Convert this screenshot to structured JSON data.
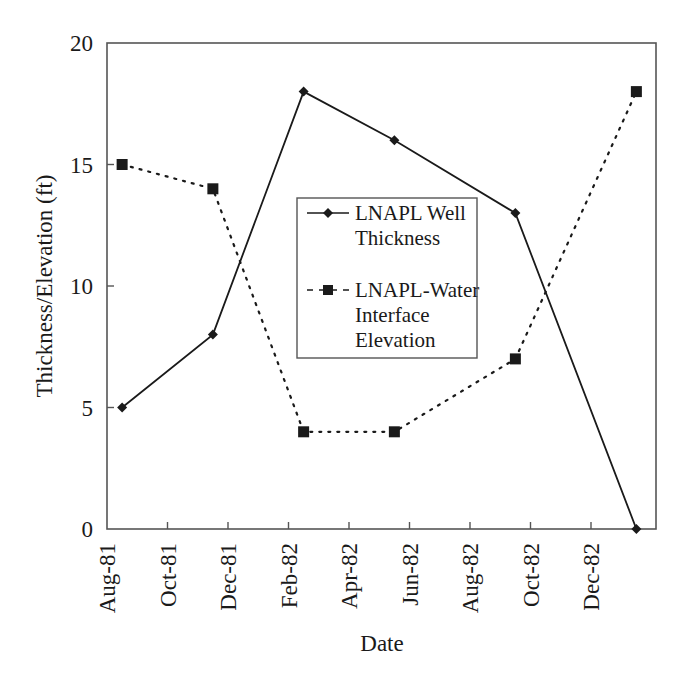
{
  "chart_data": {
    "type": "line",
    "title": "",
    "xlabel": "Date",
    "ylabel": "Thickness/Elevation (ft)",
    "ylim": [
      0,
      20
    ],
    "yticks": [
      0,
      5,
      10,
      15,
      20
    ],
    "grid": false,
    "legend_position": "center (inside plot)",
    "x_tick_labels": [
      "Aug-81",
      "Oct-81",
      "Dec-81",
      "Feb-82",
      "Apr-82",
      "Jun-82",
      "Aug-82",
      "Oct-82",
      "Dec-82"
    ],
    "x": [
      "Aug-81 (mid)",
      "Nov-81 (mid)",
      "Feb-82",
      "May-82 (mid)",
      "Sep-82",
      "Jan-83"
    ],
    "series": [
      {
        "name": "LNAPL Well Thickness",
        "marker": "diamond",
        "line_style": "solid",
        "x_month_index": [
          0.5,
          3.5,
          6.5,
          9.5,
          13.5,
          17.5
        ],
        "values": [
          5,
          8,
          18,
          16,
          13,
          0
        ]
      },
      {
        "name": "LNAPL-Water Interface Elevation",
        "marker": "square",
        "line_style": "dotted",
        "x_month_index": [
          0.5,
          3.5,
          6.5,
          9.5,
          13.5,
          17.5
        ],
        "values": [
          15,
          14,
          4,
          4,
          7,
          18
        ]
      }
    ]
  },
  "legend": {
    "series1_line1": "LNAPL Well",
    "series1_line2": "Thickness",
    "series2_line1": "LNAPL-Water",
    "series2_line2": "Interface",
    "series2_line3": "Elevation"
  },
  "colors": {
    "line": "#1a1a1a",
    "frame": "#555555",
    "background": "#ffffff"
  }
}
